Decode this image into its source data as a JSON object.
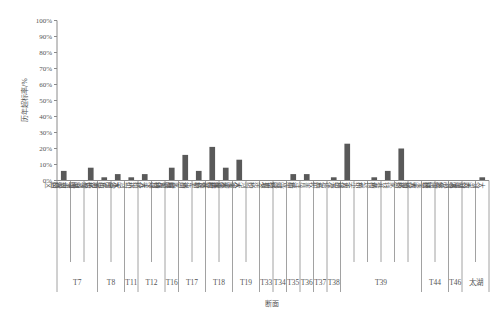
{
  "chart_data": {
    "type": "bar",
    "title": "",
    "xlabel": "断面",
    "ylabel": "历年超标率/%",
    "ylim": [
      0,
      100
    ],
    "yticks": [
      "0%",
      "10%",
      "20%",
      "30%",
      "40%",
      "50%",
      "60%",
      "70%",
      "80%",
      "90%",
      "100%"
    ],
    "grid": false,
    "legend": null,
    "categories": [
      "望桥",
      "北干河口区",
      "长荡湖湖心区",
      "东浦桥",
      "九号桥",
      "小河水闸（新孟河闸）",
      "连江桥（下）",
      "钟楼大桥",
      "前留桥",
      "潘家坝",
      "塘东桥（雁芳河）",
      "杨巷桥",
      "芳泉村",
      "大溪水库库体",
      "沙河水库库体",
      "周余桥",
      "戚墅堰",
      "遥观河桥",
      "青洋桥",
      "五牧",
      "万塔桥",
      "百渎港",
      "东尖大桥",
      "黄埝桥",
      "钱巷桥",
      "裘家",
      "雅浦桥",
      "钟溪大桥",
      "分庄桥",
      "太湖运河区",
      "太湖湖心区",
      "太湖西部区"
    ],
    "values": [
      6,
      0,
      8,
      2,
      4,
      2,
      4,
      0,
      8,
      16,
      6,
      21,
      8,
      13,
      0,
      0,
      0,
      4,
      4,
      0,
      2,
      23,
      0,
      2,
      6,
      20,
      0,
      0,
      0,
      0,
      0,
      2
    ],
    "groups": [
      {
        "label": "T7",
        "start": 0,
        "count": 3
      },
      {
        "label": "T8",
        "start": 3,
        "count": 2
      },
      {
        "label": "T11",
        "start": 5,
        "count": 1
      },
      {
        "label": "T12",
        "start": 6,
        "count": 2
      },
      {
        "label": "T16",
        "start": 8,
        "count": 1
      },
      {
        "label": "T17",
        "start": 9,
        "count": 2
      },
      {
        "label": "T18",
        "start": 11,
        "count": 2
      },
      {
        "label": "T19",
        "start": 13,
        "count": 2
      },
      {
        "label": "T33",
        "start": 15,
        "count": 1
      },
      {
        "label": "T34",
        "start": 16,
        "count": 1
      },
      {
        "label": "T35",
        "start": 17,
        "count": 1
      },
      {
        "label": "T36",
        "start": 18,
        "count": 1
      },
      {
        "label": "T37",
        "start": 19,
        "count": 1
      },
      {
        "label": "T38",
        "start": 20,
        "count": 1
      },
      {
        "label": "T39",
        "start": 21,
        "count": 6
      },
      {
        "label": "T44",
        "start": 27,
        "count": 2
      },
      {
        "label": "T46",
        "start": 29,
        "count": 1
      },
      {
        "label": "太湖",
        "start": 30,
        "count": 2
      }
    ]
  }
}
